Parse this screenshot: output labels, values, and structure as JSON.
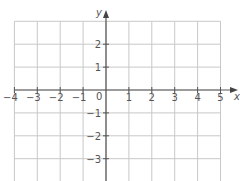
{
  "diagram": {
    "type": "coordinate-grid",
    "x_axis": {
      "label": "x",
      "min": -4,
      "max": 5,
      "tick_labels": [
        "−4",
        "−3",
        "−2",
        "−1",
        "1",
        "2",
        "3",
        "4",
        "5"
      ]
    },
    "y_axis": {
      "label": "y",
      "min": -4,
      "max": 3,
      "tick_labels": [
        "2",
        "1",
        "−1",
        "−2",
        "−3"
      ]
    },
    "origin_label": "0",
    "colors": {
      "grid": "#c8c8c8",
      "axis": "#555555",
      "text": "#555555"
    }
  }
}
